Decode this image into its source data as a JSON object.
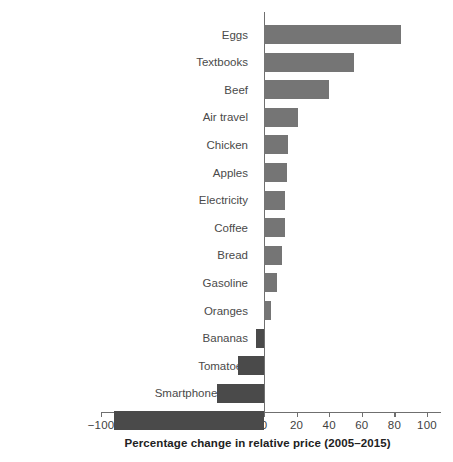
{
  "chart_data": {
    "type": "bar",
    "orientation": "horizontal",
    "title": "",
    "xlabel": "Percentage change in relative price (2005–2015)",
    "ylabel": "",
    "xlim": [
      -100,
      100
    ],
    "xticks": [
      -100,
      -80,
      -60,
      -40,
      -20,
      0,
      20,
      40,
      60,
      80,
      100
    ],
    "xtick_labels": [
      "−100",
      "−80",
      "−60",
      "−40",
      "−20",
      "0",
      "20",
      "40",
      "60",
      "80",
      "100"
    ],
    "grid": false,
    "legend": false,
    "categories": [
      "Eggs",
      "Textbooks",
      "Beef",
      "Air travel",
      "Chicken",
      "Apples",
      "Electricity",
      "Coffee",
      "Bread",
      "Gasoline",
      "Oranges",
      "Bananas",
      "Tomatoes",
      "Smartphone plans",
      "Computers"
    ],
    "values": [
      84,
      55,
      40,
      21,
      15,
      14,
      13,
      13,
      11,
      8,
      4,
      -5,
      -16,
      -29,
      -92
    ],
    "colors": {
      "positive": "#757575",
      "negative": "#4a4a4a",
      "axis": "#6f6f6f",
      "text": "#3a3a3a",
      "background": "#ffffff"
    }
  }
}
